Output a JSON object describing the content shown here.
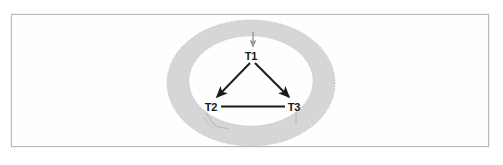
{
  "figure": {
    "type": "diagram",
    "background_color": "#ffffff",
    "frame": {
      "border_color": "#b9b9b9",
      "x": 11,
      "y": 14,
      "width": 478,
      "height": 133
    },
    "annulus": {
      "name": "gray-ring",
      "fill_color": "#d6d6d6",
      "edge_style": "stippled",
      "outer": {
        "cx": 251,
        "cy": 83,
        "rx": 84,
        "ry": 63
      },
      "inner": {
        "cx": 251,
        "cy": 81,
        "rx": 62,
        "ry": 45
      }
    },
    "nodes": [
      {
        "id": "T1",
        "label": "T1",
        "x": 251,
        "y": 57
      },
      {
        "id": "T2",
        "label": "T2",
        "x": 211,
        "y": 108
      },
      {
        "id": "T3",
        "label": "T3",
        "x": 294,
        "y": 108
      }
    ],
    "edges": [
      {
        "from": "T1",
        "to": "T2",
        "style": "arrow",
        "color": "#1a1a1a"
      },
      {
        "from": "T1",
        "to": "T3",
        "style": "arrow",
        "color": "#1a1a1a"
      },
      {
        "from": "T2",
        "to": "T3",
        "style": "line",
        "color": "#1a1a1a"
      }
    ],
    "incoming_arrow": {
      "name": "entry-arrow",
      "target": "T1",
      "color": "#9a9a9a",
      "from_x": 253,
      "from_y": 32,
      "to_x": 253,
      "to_y": 47
    },
    "faint_marks": [
      {
        "name": "t2-lower-mark",
        "color": "#bdbdbd",
        "description": "angled V mark below T2"
      },
      {
        "name": "t3-lower-mark",
        "color": "#bdbdbd",
        "description": "short vertical tick below T3"
      }
    ]
  }
}
